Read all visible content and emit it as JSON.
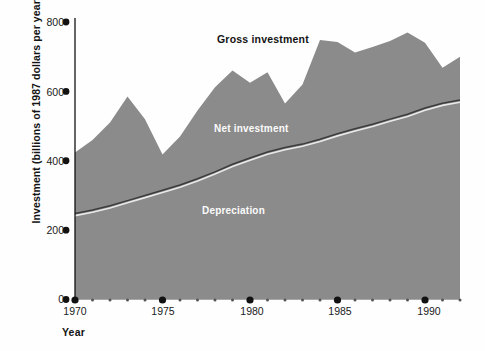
{
  "chart_data": {
    "type": "area",
    "title": "",
    "xlabel": "Year",
    "ylabel": "Investment (billions of 1987 dollars per year)",
    "xlim": [
      1970,
      1992
    ],
    "ylim": [
      0,
      800
    ],
    "xticks": [
      1970,
      1975,
      1980,
      1985,
      1990
    ],
    "xtick_labels": [
      "1970",
      "1975",
      "1980",
      "1985",
      "1990"
    ],
    "xminor_step": 1,
    "yticks": [
      0,
      200,
      400,
      600,
      800
    ],
    "ytick_labels": [
      "0",
      "200",
      "400",
      "600",
      "800"
    ],
    "grid": false,
    "legend_position": "inline-annotations",
    "x": [
      1970,
      1971,
      1972,
      1973,
      1974,
      1975,
      1976,
      1977,
      1978,
      1979,
      1980,
      1981,
      1982,
      1983,
      1984,
      1985,
      1986,
      1987,
      1988,
      1989,
      1990,
      1991,
      1992
    ],
    "series": [
      {
        "name": "Gross investment",
        "fill": "#8b8b8b",
        "values": [
          424,
          460,
          510,
          585,
          520,
          418,
          470,
          545,
          612,
          660,
          625,
          655,
          565,
          620,
          748,
          742,
          712,
          728,
          745,
          770,
          740,
          668,
          700
        ]
      },
      {
        "name": "Depreciation",
        "fill": "#8b8b8b",
        "line_color": "#3a3a3a",
        "values": [
          248,
          258,
          270,
          285,
          300,
          315,
          330,
          348,
          368,
          390,
          408,
          425,
          438,
          448,
          462,
          478,
          492,
          505,
          520,
          534,
          552,
          566,
          575
        ]
      }
    ],
    "annotations": [
      {
        "text": "Gross investment",
        "color": "#131313"
      },
      {
        "text": "Net investment",
        "color": "#fbfbfb"
      },
      {
        "text": "Depreciation",
        "color": "#fbfbfb"
      }
    ]
  },
  "axes": {
    "y_title": "Investment (billions of 1987 dollars per year)",
    "x_title": "Year",
    "y_tick_labels": [
      "800",
      "600",
      "400",
      "200",
      "0"
    ],
    "x_tick_labels": [
      "1970",
      "1975",
      "1980",
      "1985",
      "1990"
    ]
  },
  "labels": {
    "gross": "Gross investment",
    "net": "Net investment",
    "depreciation": "Depreciation"
  },
  "colors": {
    "area_fill": "#8b8b8b",
    "divider_line": "#3a3a3a",
    "divider_highlight": "#e8e8e8",
    "axis": "#111111",
    "background": "#fefefe"
  }
}
